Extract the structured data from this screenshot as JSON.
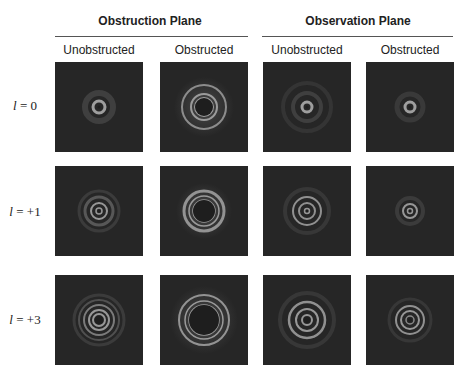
{
  "figure": {
    "groups": [
      {
        "title": "Obstruction Plane",
        "columns": [
          "Unobstructed",
          "Obstructed"
        ]
      },
      {
        "title": "Observation Plane",
        "columns": [
          "Unobstructed",
          "Obstructed"
        ]
      }
    ],
    "rows": [
      {
        "label_var": "l",
        "label_value": " = 0"
      },
      {
        "label_var": "l",
        "label_value": " = +1"
      },
      {
        "label_var": "l",
        "label_value": " = +3"
      }
    ],
    "colors": {
      "panel_bg": "#262626",
      "ring": "#b4b4b4",
      "halo": "#3a3a3a"
    },
    "panels": [
      [
        {
          "rings": [
            {
              "r": 6,
              "w": 3,
              "o": 0.85
            },
            {
              "r": 14,
              "w": 6,
              "o": 0.18
            }
          ],
          "dark_core": 1.5
        },
        {
          "rings": [
            {
              "r": 9,
              "w": 2,
              "o": 0.8
            },
            {
              "r": 13,
              "w": 2,
              "o": 0.8
            },
            {
              "r": 22,
              "w": 2,
              "o": 0.7
            }
          ],
          "dark_core": 9,
          "glow": 30
        },
        {
          "rings": [
            {
              "r": 5,
              "w": 3,
              "o": 0.85
            },
            {
              "r": 14,
              "w": 4,
              "o": 0.18
            },
            {
              "r": 24,
              "w": 4,
              "o": 0.1
            }
          ],
          "dark_core": 1.5
        },
        {
          "rings": [
            {
              "r": 5,
              "w": 3,
              "o": 0.85
            },
            {
              "r": 13,
              "w": 5,
              "o": 0.14
            }
          ],
          "dark_core": 1.5
        }
      ],
      [
        {
          "rings": [
            {
              "r": 3,
              "w": 1.5,
              "o": 0.8
            },
            {
              "r": 8,
              "w": 2,
              "o": 0.8
            },
            {
              "r": 14,
              "w": 3,
              "o": 0.35
            },
            {
              "r": 20,
              "w": 3,
              "o": 0.15
            }
          ],
          "dark_core": 1
        },
        {
          "rings": [
            {
              "r": 11,
              "w": 1.5,
              "o": 0.8
            },
            {
              "r": 15,
              "w": 1.5,
              "o": 0.8
            },
            {
              "r": 20,
              "w": 3,
              "o": 0.75
            }
          ],
          "dark_core": 11,
          "glow": 28
        },
        {
          "rings": [
            {
              "r": 2.5,
              "w": 1.5,
              "o": 0.8
            },
            {
              "r": 8,
              "w": 2,
              "o": 0.75
            },
            {
              "r": 14,
              "w": 2,
              "o": 0.75
            },
            {
              "r": 22,
              "w": 4,
              "o": 0.12
            }
          ],
          "dark_core": 1
        },
        {
          "rings": [
            {
              "r": 2.5,
              "w": 1.5,
              "o": 0.8
            },
            {
              "r": 7,
              "w": 2,
              "o": 0.8
            },
            {
              "r": 13,
              "w": 4,
              "o": 0.15
            }
          ],
          "dark_core": 1
        }
      ],
      [
        {
          "rings": [
            {
              "r": 6,
              "w": 2,
              "o": 0.8
            },
            {
              "r": 10,
              "w": 2,
              "o": 0.8
            },
            {
              "r": 15,
              "w": 2,
              "o": 0.6
            },
            {
              "r": 20,
              "w": 2,
              "o": 0.3
            },
            {
              "r": 25,
              "w": 3,
              "o": 0.15
            }
          ],
          "dark_core": 4
        },
        {
          "rings": [
            {
              "r": 15,
              "w": 1.5,
              "o": 0.8
            },
            {
              "r": 19,
              "w": 1.5,
              "o": 0.8
            },
            {
              "r": 25,
              "w": 2,
              "o": 0.75
            }
          ],
          "dark_core": 15,
          "glow": 34
        },
        {
          "rings": [
            {
              "r": 5,
              "w": 2,
              "o": 0.8
            },
            {
              "r": 11,
              "w": 2,
              "o": 0.8
            },
            {
              "r": 18,
              "w": 2.5,
              "o": 0.75
            },
            {
              "r": 27,
              "w": 4,
              "o": 0.12
            }
          ],
          "dark_core": 3
        },
        {
          "rings": [
            {
              "r": 4,
              "w": 1.5,
              "o": 0.7
            },
            {
              "r": 9,
              "w": 2,
              "o": 0.8
            },
            {
              "r": 14,
              "w": 2,
              "o": 0.75
            },
            {
              "r": 21,
              "w": 3,
              "o": 0.12
            }
          ],
          "dark_core": 2
        }
      ]
    ]
  }
}
